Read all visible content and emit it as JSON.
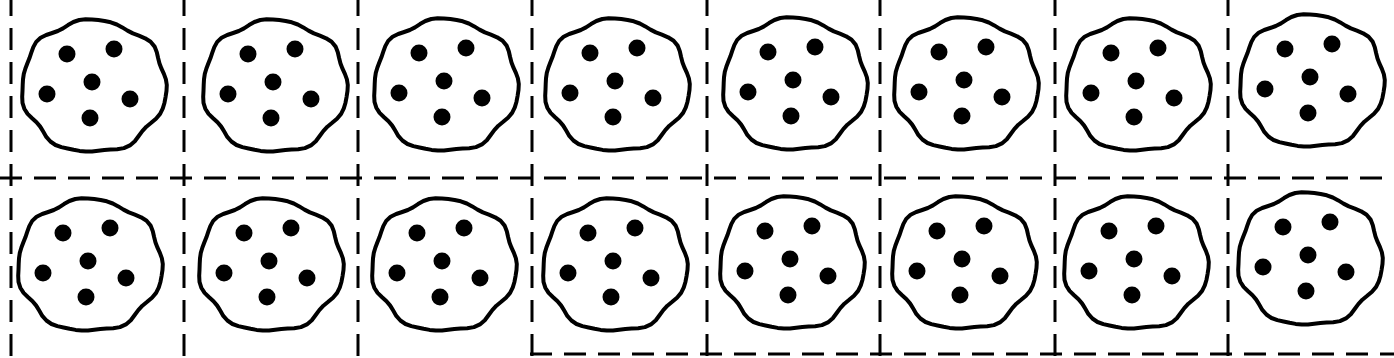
{
  "worksheet": {
    "rows": 2,
    "columns": 8,
    "cookie_count": 16,
    "chips_per_cookie": 6,
    "colors": {
      "background": "#ffffff",
      "ink": "#000000"
    }
  },
  "grid": {
    "vertical_lines_x": [
      11,
      184,
      358,
      532,
      707,
      880,
      1055,
      1228
    ],
    "horizontal_lines_y": [
      178,
      354
    ],
    "bottom_line_start_x": 530
  },
  "cookies": [
    {
      "cx": 92,
      "cy": 85
    },
    {
      "cx": 273,
      "cy": 85
    },
    {
      "cx": 444,
      "cy": 84
    },
    {
      "cx": 615,
      "cy": 84
    },
    {
      "cx": 793,
      "cy": 83
    },
    {
      "cx": 964,
      "cy": 83
    },
    {
      "cx": 1136,
      "cy": 84
    },
    {
      "cx": 1310,
      "cy": 80
    },
    {
      "cx": 88,
      "cy": 264
    },
    {
      "cx": 269,
      "cy": 264
    },
    {
      "cx": 442,
      "cy": 264
    },
    {
      "cx": 613,
      "cy": 264
    },
    {
      "cx": 790,
      "cy": 262
    },
    {
      "cx": 962,
      "cy": 262
    },
    {
      "cx": 1134,
      "cy": 262
    },
    {
      "cx": 1308,
      "cy": 258
    }
  ],
  "chip_offsets": [
    [
      -25,
      -31
    ],
    [
      22,
      -36
    ],
    [
      0,
      -3
    ],
    [
      -45,
      9
    ],
    [
      38,
      14
    ],
    [
      -2,
      33
    ]
  ]
}
